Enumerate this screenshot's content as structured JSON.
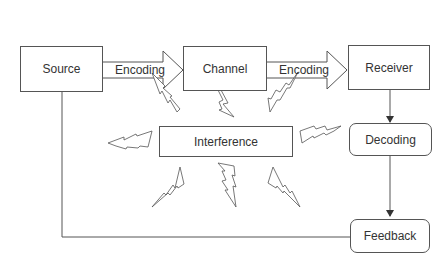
{
  "diagram": {
    "nodes": {
      "source": "Source",
      "channel": "Channel",
      "receiver": "Receiver",
      "interference": "Interference",
      "decoding": "Decoding",
      "feedback": "Feedback"
    },
    "edges": {
      "source_to_channel": "Encoding",
      "channel_to_receiver": "Encoding"
    },
    "colors": {
      "stroke": "#555555",
      "text": "#333333",
      "background": "#ffffff"
    }
  }
}
